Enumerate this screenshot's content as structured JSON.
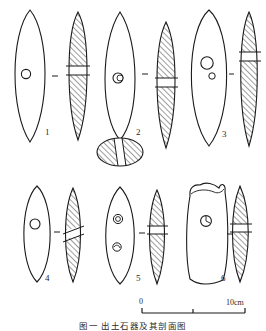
{
  "figure": {
    "caption": "图一  出土石器及其剖面图",
    "background_color": "#ffffff",
    "ink_color": "#1a1a1a",
    "hatch_color": "#555555"
  },
  "scale_bar": {
    "name": "scale-bar",
    "start_label": "0",
    "end_label": "10cm",
    "ticks": [
      "0",
      "5",
      "10"
    ],
    "unit": "cm",
    "length_value": 10
  },
  "artifacts": [
    {
      "number": "1",
      "label": "1",
      "shape": "elongated-lenticular",
      "views": [
        "plan",
        "section"
      ],
      "perforations": 1,
      "section_band": "horizontal",
      "notes": "single small central perforation"
    },
    {
      "number": "2",
      "label": "2",
      "shape": "elongated-lenticular-pointed",
      "views": [
        "plan",
        "section",
        "end-view"
      ],
      "perforations": 1,
      "section_band": "horizontal",
      "notes": "double-ring perforation; extra oval end view below"
    },
    {
      "number": "3",
      "label": "3",
      "shape": "broad-oval",
      "views": [
        "plan",
        "section"
      ],
      "perforations": 2,
      "section_band": "horizontal",
      "notes": "one large and one small perforation"
    },
    {
      "number": "4",
      "label": "4",
      "shape": "rounded-oblong",
      "views": [
        "plan",
        "section"
      ],
      "perforations": 1,
      "section_band": "oblique",
      "notes": "single central perforation"
    },
    {
      "number": "5",
      "label": "5",
      "shape": "narrow-oval",
      "views": [
        "plan",
        "section"
      ],
      "perforations": 2,
      "section_band": "horizontal",
      "notes": "two irregular perforation marks"
    },
    {
      "number": "6",
      "label": "6",
      "shape": "irregular-broken-rectangular",
      "views": [
        "plan",
        "section"
      ],
      "perforations": 1,
      "section_band": "horizontal",
      "notes": "broken/notched upper edge"
    }
  ]
}
